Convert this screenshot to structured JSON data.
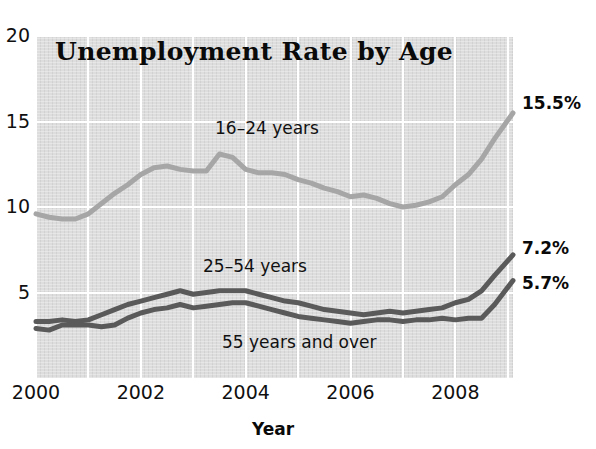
{
  "chart_data": {
    "type": "line",
    "title": "Unemployment Rate by Age",
    "xlabel": "Year",
    "ylabel": "",
    "xlim": [
      2000,
      2009.1
    ],
    "ylim": [
      0,
      20
    ],
    "grid": true,
    "legend_position": "inline-annotations",
    "xticks": [
      "2000",
      "2002",
      "2004",
      "2006",
      "2008"
    ],
    "xtick_values": [
      2000,
      2002,
      2004,
      2006,
      2008
    ],
    "yticks": [
      "5",
      "10",
      "15",
      "20"
    ],
    "ytick_values": [
      5,
      10,
      15,
      20
    ],
    "series": [
      {
        "name": "16-24 years",
        "label": "16–24 years",
        "color": "#a6a6a6",
        "end_value_label": "15.5%",
        "end_value": 15.5,
        "x": [
          2000.0,
          2000.25,
          2000.5,
          2000.75,
          2001.0,
          2001.25,
          2001.5,
          2001.75,
          2002.0,
          2002.25,
          2002.5,
          2002.75,
          2003.0,
          2003.25,
          2003.5,
          2003.75,
          2004.0,
          2004.25,
          2004.5,
          2004.75,
          2005.0,
          2005.25,
          2005.5,
          2005.75,
          2006.0,
          2006.25,
          2006.5,
          2006.75,
          2007.0,
          2007.25,
          2007.5,
          2007.75,
          2008.0,
          2008.25,
          2008.5,
          2008.75,
          2009.1
        ],
        "values": [
          9.6,
          9.4,
          9.3,
          9.3,
          9.6,
          10.2,
          10.8,
          11.3,
          11.9,
          12.3,
          12.4,
          12.2,
          12.1,
          12.1,
          13.1,
          12.9,
          12.2,
          12.0,
          12.0,
          11.9,
          11.6,
          11.4,
          11.1,
          10.9,
          10.6,
          10.7,
          10.5,
          10.2,
          10.0,
          10.1,
          10.3,
          10.6,
          11.3,
          11.9,
          12.8,
          14.0,
          15.5
        ]
      },
      {
        "name": "25-54 years",
        "label": "25–54 years",
        "color": "#5a5a5a",
        "end_value_label": "7.2%",
        "end_value": 7.2,
        "x": [
          2000.0,
          2000.25,
          2000.5,
          2000.75,
          2001.0,
          2001.25,
          2001.5,
          2001.75,
          2002.0,
          2002.25,
          2002.5,
          2002.75,
          2003.0,
          2003.25,
          2003.5,
          2003.75,
          2004.0,
          2004.25,
          2004.5,
          2004.75,
          2005.0,
          2005.25,
          2005.5,
          2005.75,
          2006.0,
          2006.25,
          2006.5,
          2006.75,
          2007.0,
          2007.25,
          2007.5,
          2007.75,
          2008.0,
          2008.25,
          2008.5,
          2008.75,
          2009.1
        ],
        "values": [
          3.3,
          3.3,
          3.4,
          3.3,
          3.4,
          3.7,
          4.0,
          4.3,
          4.5,
          4.7,
          4.9,
          5.1,
          4.9,
          5.0,
          5.1,
          5.1,
          5.1,
          4.9,
          4.7,
          4.5,
          4.4,
          4.2,
          4.0,
          3.9,
          3.8,
          3.7,
          3.8,
          3.9,
          3.8,
          3.9,
          4.0,
          4.1,
          4.4,
          4.6,
          5.1,
          6.0,
          7.2
        ]
      },
      {
        "name": "55 years and over",
        "label": "55 years and over",
        "color": "#5a5a5a",
        "end_value_label": "5.7%",
        "end_value": 5.7,
        "x": [
          2000.0,
          2000.25,
          2000.5,
          2000.75,
          2001.0,
          2001.25,
          2001.5,
          2001.75,
          2002.0,
          2002.25,
          2002.5,
          2002.75,
          2003.0,
          2003.25,
          2003.5,
          2003.75,
          2004.0,
          2004.25,
          2004.5,
          2004.75,
          2005.0,
          2005.25,
          2005.5,
          2005.75,
          2006.0,
          2006.25,
          2006.5,
          2006.75,
          2007.0,
          2007.25,
          2007.5,
          2007.75,
          2008.0,
          2008.25,
          2008.5,
          2008.75,
          2009.1
        ],
        "values": [
          2.9,
          2.8,
          3.1,
          3.1,
          3.1,
          3.0,
          3.1,
          3.5,
          3.8,
          4.0,
          4.1,
          4.3,
          4.1,
          4.2,
          4.3,
          4.4,
          4.4,
          4.2,
          4.0,
          3.8,
          3.6,
          3.5,
          3.4,
          3.3,
          3.2,
          3.3,
          3.4,
          3.4,
          3.3,
          3.4,
          3.4,
          3.5,
          3.4,
          3.5,
          3.5,
          4.3,
          5.7
        ]
      }
    ]
  }
}
